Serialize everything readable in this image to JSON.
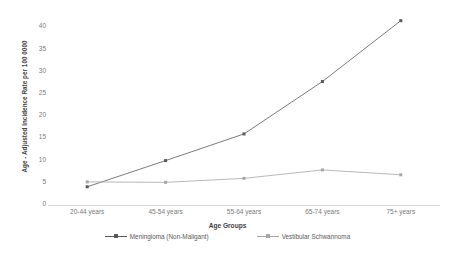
{
  "chart_data": {
    "type": "line",
    "title": "",
    "xlabel": "Age Groups",
    "ylabel": "Age - Adjusted Incidence Rate per 100 0000",
    "categories": [
      "20-44 years",
      "45-54 years",
      "55-64 years",
      "65-74 years",
      "75+ years"
    ],
    "ylim": [
      0,
      43
    ],
    "yticks": [
      0,
      5,
      10,
      15,
      20,
      25,
      30,
      35,
      40
    ],
    "ytick_labels": [
      "0",
      "5",
      "10",
      "15",
      "20",
      "25",
      "30",
      "35",
      "40"
    ],
    "grid": false,
    "legend_position": "bottom",
    "series": [
      {
        "name": "Meningioma (Non-Maligant)",
        "color": "#595959",
        "marker": "square",
        "values": [
          4.1,
          10.0,
          16.0,
          27.8,
          41.5
        ]
      },
      {
        "name": "Vestibular Schwannoma",
        "color": "#a6a6a6",
        "marker": "square",
        "values": [
          5.2,
          5.1,
          6.0,
          7.9,
          6.8
        ]
      }
    ]
  },
  "legend": {
    "items": [
      {
        "label": "Meningioma (Non-Maligant)"
      },
      {
        "label": "Vestibular Schwannoma"
      }
    ]
  },
  "colors": {
    "series_1": "#595959",
    "series_2": "#a6a6a6",
    "axis": "#d9d9d9",
    "text": "#7a7a7a",
    "title_text": "#3f3f3f",
    "background": "#ffffff"
  }
}
